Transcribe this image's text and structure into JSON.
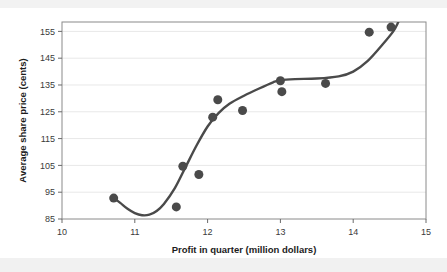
{
  "chart_data": {
    "type": "scatter",
    "title": "",
    "xlabel": "Profit in quarter (million dollars)",
    "ylabel": "Average share price (cents)",
    "xlim": [
      10,
      15
    ],
    "ylim": [
      85,
      158.5
    ],
    "xticks": [
      10,
      11,
      12,
      13,
      14,
      15
    ],
    "yticks": [
      85,
      95,
      105,
      115,
      125,
      135,
      145,
      155
    ],
    "xtick_labels": [
      "10",
      "11",
      "12",
      "13",
      "14",
      "15"
    ],
    "ytick_labels": [
      "85",
      "95",
      "105",
      "115",
      "125",
      "135",
      "145",
      "155"
    ],
    "grid": true,
    "grid_axis": "y",
    "legend": false,
    "legend_position": "none",
    "marker": "circle",
    "marker_color": "#4a4a4a",
    "marker_size": 9,
    "points": [
      {
        "x": 10.71,
        "y": 92.8
      },
      {
        "x": 11.57,
        "y": 89.5
      },
      {
        "x": 11.66,
        "y": 104.7
      },
      {
        "x": 11.88,
        "y": 101.6
      },
      {
        "x": 12.07,
        "y": 123.0
      },
      {
        "x": 12.14,
        "y": 129.5
      },
      {
        "x": 12.48,
        "y": 125.5
      },
      {
        "x": 13.0,
        "y": 136.6
      },
      {
        "x": 13.02,
        "y": 132.5
      },
      {
        "x": 13.62,
        "y": 135.6
      },
      {
        "x": 14.22,
        "y": 154.7
      },
      {
        "x": 14.52,
        "y": 156.6
      }
    ],
    "trend_curve": {
      "name": "fitted cubic trend line",
      "color": "#4a4a4a",
      "points": [
        {
          "x": 10.71,
          "y": 92.9
        },
        {
          "x": 10.8,
          "y": 91.0
        },
        {
          "x": 10.9,
          "y": 88.8
        },
        {
          "x": 11.0,
          "y": 87.2
        },
        {
          "x": 11.1,
          "y": 86.4
        },
        {
          "x": 11.2,
          "y": 86.6
        },
        {
          "x": 11.3,
          "y": 88.0
        },
        {
          "x": 11.4,
          "y": 90.6
        },
        {
          "x": 11.55,
          "y": 96.5
        },
        {
          "x": 11.7,
          "y": 104.5
        },
        {
          "x": 11.85,
          "y": 112.5
        },
        {
          "x": 12.0,
          "y": 119.5
        },
        {
          "x": 12.15,
          "y": 124.5
        },
        {
          "x": 12.3,
          "y": 128.0
        },
        {
          "x": 12.5,
          "y": 131.0
        },
        {
          "x": 12.7,
          "y": 133.6
        },
        {
          "x": 12.9,
          "y": 136.0
        },
        {
          "x": 13.0,
          "y": 136.8
        },
        {
          "x": 13.2,
          "y": 137.2
        },
        {
          "x": 13.5,
          "y": 137.4
        },
        {
          "x": 13.8,
          "y": 138.2
        },
        {
          "x": 14.0,
          "y": 140.0
        },
        {
          "x": 14.2,
          "y": 144.0
        },
        {
          "x": 14.4,
          "y": 150.0
        },
        {
          "x": 14.55,
          "y": 155.0
        },
        {
          "x": 14.62,
          "y": 158.5
        }
      ]
    }
  }
}
